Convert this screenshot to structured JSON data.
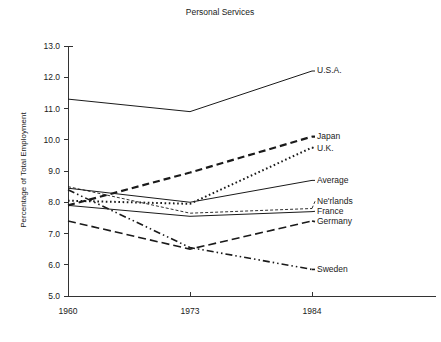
{
  "chart_data": {
    "type": "line",
    "title": "Personal Services",
    "xlabel": "",
    "ylabel": "Percentage of Total Employment",
    "categories": [
      "1960",
      "1973",
      "1984"
    ],
    "x": [
      1960,
      1973,
      1984
    ],
    "xticklabels": [
      "1960",
      "1973",
      "1984"
    ],
    "yticklabels": [
      "5.0",
      "6.0",
      "7.0",
      "8.0",
      "9.0",
      "10.0",
      "11.0",
      "12.0",
      "13.0"
    ],
    "yticks": [
      5.0,
      6.0,
      7.0,
      8.0,
      9.0,
      10.0,
      11.0,
      12.0,
      13.0
    ],
    "ylim": [
      5.0,
      13.0
    ],
    "grid": false,
    "legend_position": "right-inline-labels",
    "series": [
      {
        "name": "U.S.A.",
        "values": [
          11.3,
          10.9,
          12.2
        ],
        "style": "solid",
        "dash": "none",
        "width": 1.0,
        "label_y": 12.2
      },
      {
        "name": "Japan",
        "values": [
          7.9,
          8.95,
          10.1
        ],
        "style": "thick-dashed",
        "dash": "7,4",
        "width": 2.2,
        "label_y": 10.1
      },
      {
        "name": "U.K.",
        "values": [
          8.05,
          7.95,
          9.75
        ],
        "style": "dotted",
        "dash": "1.6,2.6",
        "width": 2.0,
        "label_y": 9.72
      },
      {
        "name": "Average",
        "values": [
          8.45,
          8.0,
          8.7
        ],
        "style": "solid",
        "dash": "none",
        "width": 1.0,
        "label_y": 8.7
      },
      {
        "name": "Ne'rlands",
        "values": [
          8.5,
          7.65,
          7.8
        ],
        "style": "short-dashed",
        "dash": "3,2",
        "width": 0.9,
        "label_y": 8.03
      },
      {
        "name": "France",
        "values": [
          7.9,
          7.55,
          7.7
        ],
        "style": "solid",
        "dash": "none",
        "width": 1.0,
        "label_y": 7.71
      },
      {
        "name": "Germany",
        "values": [
          7.4,
          6.5,
          7.4
        ],
        "style": "long-dashed",
        "dash": "8,4",
        "width": 1.6,
        "label_y": 7.38
      },
      {
        "name": "Sweden",
        "values": [
          8.4,
          6.55,
          5.85
        ],
        "style": "dash-dot-dot",
        "dash": "7,3,1.5,3,1.5,3",
        "width": 1.6,
        "label_y": 5.85
      }
    ],
    "annotations": [
      "U.S.A. rises sharply after 1973",
      "Sweden declines continuously"
    ],
    "colors": {
      "line": "#1a1a1a",
      "axis": "#333333",
      "text": "#1a1a1a",
      "background": "#ffffff"
    }
  }
}
